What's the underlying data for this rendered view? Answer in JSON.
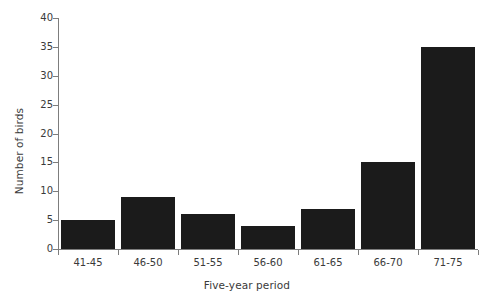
{
  "chart_data": {
    "type": "bar",
    "title": "",
    "subtitle": "",
    "xlabel": "Five-year period",
    "ylabel": "Number of birds",
    "categories": [
      "41-45",
      "46-50",
      "51-55",
      "56-60",
      "61-65",
      "66-70",
      "71-75"
    ],
    "values": [
      5,
      9,
      6,
      4,
      7,
      15,
      35
    ],
    "ylim": [
      0,
      40
    ],
    "yticks": [
      0,
      5,
      10,
      15,
      20,
      25,
      30,
      35,
      40
    ],
    "ytick_labels": [
      "0",
      "5",
      "10",
      "15",
      "20",
      "25",
      "30",
      "35",
      "40"
    ],
    "grid": false,
    "legend": null,
    "legend_position": "none",
    "bar_color": "#1b1b1b",
    "axis_color": "#7d7d7d",
    "text_color": "#3a3a3a",
    "annotations": []
  }
}
